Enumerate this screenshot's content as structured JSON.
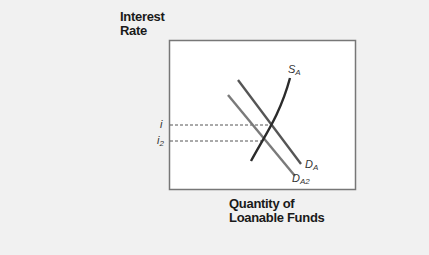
{
  "axes": {
    "y_label_line1": "Interest",
    "y_label_line2": "Rate",
    "x_label_line1": "Quantity of",
    "x_label_line2": "Loanable Funds"
  },
  "curves": {
    "supply": {
      "label": "S",
      "subscript": "A",
      "color": "#2b2b2b"
    },
    "demand": {
      "label": "D",
      "subscript": "A",
      "color": "#555555"
    },
    "demand2": {
      "label": "D",
      "subscript": "A2",
      "color": "#7a7a7a"
    }
  },
  "rates": {
    "i": {
      "label": "i",
      "subscript": ""
    },
    "i2": {
      "label": "i",
      "subscript": "2"
    }
  }
}
